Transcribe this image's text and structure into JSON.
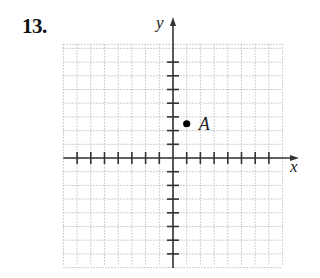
{
  "problem": {
    "number_label": "13."
  },
  "axes": {
    "x_label": "x",
    "y_label": "y",
    "x_range": [
      -8,
      8
    ],
    "y_range": [
      -8,
      8
    ],
    "tick_step": 1
  },
  "points": [
    {
      "label": "A",
      "x": 1,
      "y": 2.5
    }
  ],
  "style": {
    "grid_color": "#b0b0b0",
    "axis_color": "#333333",
    "point_color": "#000000"
  }
}
